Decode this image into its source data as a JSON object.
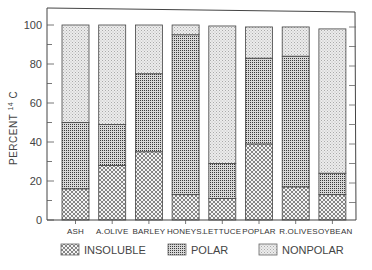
{
  "chart_data": {
    "type": "bar",
    "stacked": true,
    "title": "",
    "xlabel": "",
    "ylabel": "PERCENT 14C",
    "ylim": [
      0,
      100
    ],
    "yticks": [
      0,
      20,
      40,
      60,
      80,
      100
    ],
    "categories": [
      "ASH",
      "A.OLIVE",
      "BARLEY",
      "HONEYS.",
      "LETTUCE",
      "POPLAR",
      "R.OLIVE",
      "SOYBEAN"
    ],
    "series": [
      {
        "name": "INSOLUBLE",
        "pattern": "crosshatch",
        "values": [
          16,
          28,
          35,
          13,
          11,
          39,
          17,
          13
        ]
      },
      {
        "name": "POLAR",
        "pattern": "dense-grid",
        "values": [
          34,
          21,
          40,
          82,
          18,
          44,
          67,
          11
        ]
      },
      {
        "name": "NONPOLAR",
        "pattern": "light-stipple",
        "values": [
          50,
          51,
          25,
          5,
          70.5,
          16,
          15,
          74
        ]
      }
    ],
    "totals": [
      100,
      100,
      100,
      100,
      99.5,
      99,
      99,
      98
    ],
    "grid": false,
    "legend_position": "bottom"
  },
  "legend": {
    "items": [
      {
        "label": "INSOLUBLE"
      },
      {
        "label": "POLAR"
      },
      {
        "label": "NONPOLAR"
      }
    ]
  },
  "axis": {
    "ylabel_main": "PERCENT",
    "ylabel_sup": "14",
    "ylabel_tail": "C",
    "ytick_labels": [
      "0",
      "20",
      "40",
      "60",
      "80",
      "100"
    ]
  }
}
